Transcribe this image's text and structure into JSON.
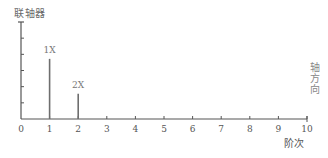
{
  "chart_data": {
    "type": "bar",
    "title": "",
    "ylabel": "联轴器",
    "xlabel": "阶次",
    "side_label": "轴方向",
    "x": [
      1,
      2
    ],
    "values": [
      0.62,
      0.26
    ],
    "bar_labels": [
      "1X",
      "2X"
    ],
    "xticks": [
      "0",
      "1",
      "2",
      "3",
      "4",
      "5",
      "6",
      "7",
      "8",
      "9",
      "10"
    ],
    "xlim": [
      0,
      10
    ],
    "ylim": [
      0,
      1
    ],
    "yticks_count": 6,
    "yticks_labeled": false,
    "grid": false,
    "legend": null
  },
  "colors": {
    "axis": "#555555",
    "bar": "#6e6e6e",
    "text": "#555555"
  }
}
